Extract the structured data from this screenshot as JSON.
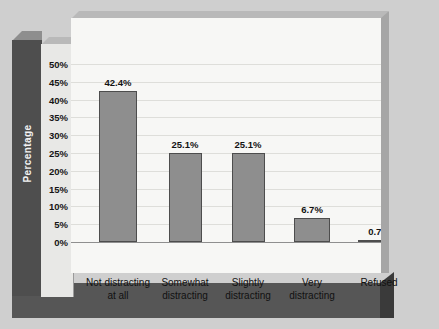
{
  "chart_data": {
    "type": "bar",
    "title": "",
    "xlabel": "",
    "ylabel": "Percentage",
    "categories": [
      "Not distracting at all",
      "Somewhat distracting",
      "Slightly distracting",
      "Very distracting",
      "Refused"
    ],
    "category_lines": [
      [
        "Not distracting",
        "at all"
      ],
      [
        "Somewhat",
        "distracting"
      ],
      [
        "Slightly",
        "distracting"
      ],
      [
        "Very",
        "distracting"
      ],
      [
        "Refused"
      ]
    ],
    "values": [
      42.4,
      25.1,
      25.1,
      6.7,
      0.7
    ],
    "value_labels": [
      "42.4%",
      "25.1%",
      "25.1%",
      "6.7%",
      "0.7%"
    ],
    "ylim": [
      0,
      50
    ],
    "ytick_values": [
      50,
      45,
      40,
      35,
      30,
      25,
      20,
      15,
      10,
      5,
      0
    ],
    "ytick_labels": [
      "50%",
      "45%",
      "40%",
      "35%",
      "30%",
      "25%",
      "20%",
      "15%",
      "10%",
      "5%",
      "0%"
    ],
    "grid": true,
    "legend": false,
    "legend_position": "none",
    "colors": {
      "bar_fill": "#8e8e8e",
      "bar_border": "#4d4d4d",
      "plot_background": "#f7f7f5",
      "gridline": "#dededa",
      "axis_line": "#8f8f8f",
      "y_panel": "#4e4e4e",
      "y_panel_text": "#f2f2f2",
      "page_background": "#cfcfcf",
      "base_slab": "#565656",
      "tick_text": "#151515"
    }
  }
}
